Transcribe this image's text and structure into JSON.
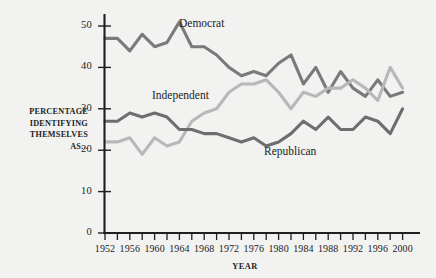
{
  "chart_data": {
    "type": "line",
    "title": "",
    "xlabel": "YEAR",
    "ylabel": "PERCENTAGE IDENTIFYING THEMSELVES AS...",
    "ylabel_lines": [
      "PERCENTAGE",
      "IDENTIFYING",
      "THEMSELVES",
      "AS..."
    ],
    "xlim": [
      1952,
      2002
    ],
    "ylim": [
      0,
      54
    ],
    "yticks": [
      0,
      10,
      20,
      30,
      40,
      50
    ],
    "ytick_labels": [
      "0",
      "10",
      "20",
      "30",
      "40",
      "50"
    ],
    "xticks": [
      1952,
      1954,
      1956,
      1958,
      1960,
      1962,
      1964,
      1966,
      1968,
      1970,
      1972,
      1974,
      1976,
      1978,
      1980,
      1982,
      1984,
      1986,
      1988,
      1990,
      1992,
      1994,
      1996,
      1998,
      2000
    ],
    "xtick_labels": [
      "1952",
      "1956",
      "1960",
      "1964",
      "1968",
      "1972",
      "1976",
      "1980",
      "1984",
      "1988",
      "1992",
      "1996",
      "2000"
    ],
    "xtick_labeled_years": [
      1952,
      1956,
      1960,
      1964,
      1968,
      1972,
      1976,
      1980,
      1984,
      1988,
      1992,
      1996,
      2000
    ],
    "grid": false,
    "legend_position": "inline-annotations",
    "x": [
      1952,
      1954,
      1956,
      1958,
      1960,
      1962,
      1964,
      1966,
      1968,
      1970,
      1972,
      1974,
      1976,
      1978,
      1980,
      1982,
      1984,
      1986,
      1988,
      1990,
      1992,
      1994,
      1996,
      1998,
      2000
    ],
    "series": [
      {
        "name": "Democrat",
        "color": "#7a7a7a",
        "values": [
          47,
          47,
          44,
          48,
          45,
          46,
          51,
          45,
          45,
          43,
          40,
          38,
          39,
          38,
          41,
          43,
          36,
          40,
          34,
          39,
          35,
          33,
          37,
          33,
          34
        ]
      },
      {
        "name": "Independent",
        "color": "#b8b8b8",
        "values": [
          22,
          22,
          23,
          19,
          23,
          21,
          22,
          27,
          29,
          30,
          34,
          36,
          36,
          37,
          34,
          30,
          34,
          33,
          35,
          35,
          37,
          35,
          32,
          40,
          35
        ]
      },
      {
        "name": "Republican",
        "color": "#6e6e6e",
        "values": [
          27,
          27,
          29,
          28,
          29,
          28,
          25,
          25,
          24,
          24,
          23,
          22,
          23,
          21,
          22,
          24,
          27,
          25,
          28,
          25,
          25,
          28,
          27,
          24,
          30
        ]
      }
    ],
    "annotations": [
      {
        "text": "Democrat",
        "series": "Democrat"
      },
      {
        "text": "Independent",
        "series": "Independent"
      },
      {
        "text": "Republican",
        "series": "Republican"
      }
    ],
    "background_color": "#f2f2f0",
    "axis_color": "#1f1f1f"
  }
}
